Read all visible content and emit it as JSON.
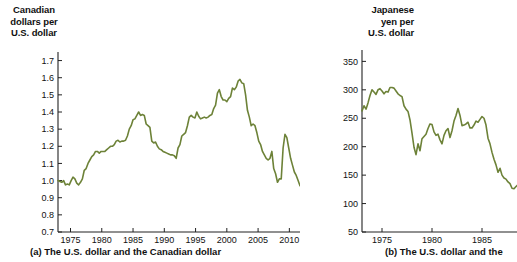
{
  "figure": {
    "background": "#ffffff",
    "line_color": "#6d8238",
    "axis_color": "#222222",
    "text_color": "#111111"
  },
  "panels": [
    {
      "id": "panel-a",
      "axis_title": "Canadian\ndollars per\nU.S. dollar",
      "caption": "(a) The U.S. dollar and the Canadian dollar"
    },
    {
      "id": "panel-b",
      "axis_title": "Japanese\nyen per\nU.S. dollar",
      "caption": "(b) The U.S. dollar and the"
    }
  ],
  "chart_data": [
    {
      "type": "line",
      "title": "(a) The U.S. dollar and the Canadian dollar",
      "xlabel": "",
      "ylabel": "Canadian dollars per U.S. dollar",
      "xlim": [
        1973,
        2016.5
      ],
      "ylim": [
        0.7,
        1.75
      ],
      "xticks": [
        1975,
        1980,
        1985,
        1990,
        1995,
        2000,
        2005,
        2010,
        2015
      ],
      "yticks": [
        0.7,
        0.8,
        0.9,
        1.0,
        1.1,
        1.2,
        1.3,
        1.4,
        1.5,
        1.6,
        1.7
      ],
      "grid": false,
      "legend": "none",
      "line_color": "#6d8238",
      "series": [
        {
          "name": "CAD per USD",
          "x": [
            1973.0,
            1973.3,
            1973.6,
            1973.9,
            1974.2,
            1974.5,
            1974.8,
            1975.1,
            1975.4,
            1975.7,
            1976.0,
            1976.3,
            1976.6,
            1976.9,
            1977.2,
            1977.5,
            1977.8,
            1978.1,
            1978.4,
            1978.7,
            1979.0,
            1979.3,
            1979.6,
            1979.9,
            1980.2,
            1980.5,
            1980.8,
            1981.1,
            1981.4,
            1981.7,
            1982.0,
            1982.3,
            1982.6,
            1982.9,
            1983.2,
            1983.5,
            1983.8,
            1984.1,
            1984.4,
            1984.7,
            1985.0,
            1985.3,
            1985.6,
            1985.9,
            1986.2,
            1986.5,
            1986.8,
            1987.1,
            1987.4,
            1987.7,
            1988.0,
            1988.3,
            1988.6,
            1988.9,
            1989.2,
            1989.5,
            1989.8,
            1990.1,
            1990.4,
            1990.7,
            1991.0,
            1991.3,
            1991.6,
            1991.9,
            1992.2,
            1992.5,
            1992.8,
            1993.1,
            1993.4,
            1993.7,
            1994.0,
            1994.3,
            1994.6,
            1994.9,
            1995.2,
            1995.5,
            1995.8,
            1996.1,
            1996.4,
            1996.7,
            1997.0,
            1997.3,
            1997.6,
            1997.9,
            1998.2,
            1998.5,
            1998.8,
            1999.1,
            1999.4,
            1999.7,
            2000.0,
            2000.3,
            2000.6,
            2000.9,
            2001.2,
            2001.5,
            2001.8,
            2002.1,
            2002.4,
            2002.7,
            2003.0,
            2003.3,
            2003.6,
            2003.9,
            2004.2,
            2004.5,
            2004.8,
            2005.1,
            2005.4,
            2005.7,
            2006.0,
            2006.3,
            2006.6,
            2006.9,
            2007.2,
            2007.5,
            2007.8,
            2008.1,
            2008.4,
            2008.7,
            2009.0,
            2009.3,
            2009.6,
            2009.9,
            2010.2,
            2010.5,
            2010.8,
            2011.1,
            2011.4,
            2011.7,
            2012.0,
            2012.3,
            2012.6,
            2012.9,
            2013.2,
            2013.5,
            2013.8,
            2014.1,
            2014.4,
            2014.7,
            2015.0,
            2015.3,
            2015.6,
            2015.9,
            2016.2
          ],
          "y": [
            1.0,
            0.995,
            0.99,
            1.0,
            0.975,
            0.98,
            0.975,
            1.0,
            1.02,
            1.01,
            0.985,
            0.975,
            0.99,
            1.01,
            1.06,
            1.07,
            1.1,
            1.12,
            1.14,
            1.15,
            1.17,
            1.17,
            1.16,
            1.17,
            1.17,
            1.17,
            1.18,
            1.19,
            1.2,
            1.2,
            1.21,
            1.23,
            1.235,
            1.225,
            1.23,
            1.23,
            1.235,
            1.26,
            1.3,
            1.32,
            1.355,
            1.36,
            1.38,
            1.4,
            1.38,
            1.385,
            1.38,
            1.33,
            1.32,
            1.31,
            1.23,
            1.22,
            1.225,
            1.2,
            1.185,
            1.18,
            1.17,
            1.165,
            1.16,
            1.155,
            1.15,
            1.15,
            1.145,
            1.13,
            1.19,
            1.21,
            1.26,
            1.27,
            1.28,
            1.32,
            1.37,
            1.38,
            1.37,
            1.365,
            1.4,
            1.375,
            1.36,
            1.365,
            1.37,
            1.365,
            1.37,
            1.38,
            1.385,
            1.42,
            1.44,
            1.51,
            1.53,
            1.49,
            1.47,
            1.47,
            1.46,
            1.48,
            1.49,
            1.54,
            1.53,
            1.545,
            1.58,
            1.59,
            1.57,
            1.565,
            1.5,
            1.41,
            1.37,
            1.32,
            1.33,
            1.32,
            1.28,
            1.23,
            1.21,
            1.17,
            1.15,
            1.13,
            1.12,
            1.13,
            1.17,
            1.07,
            1.04,
            0.99,
            1.01,
            1.01,
            1.19,
            1.27,
            1.25,
            1.19,
            1.13,
            1.09,
            1.05,
            1.03,
            1.0,
            0.97,
            0.98,
            1.01,
            1.0,
            0.99,
            1.0,
            1.0,
            1.02,
            1.04,
            1.06,
            1.09,
            1.1,
            1.13,
            1.2,
            1.24,
            1.3,
            1.33
          ]
        }
      ]
    },
    {
      "type": "line",
      "title": "(b) The U.S. dollar and the",
      "xlabel": "",
      "ylabel": "Japanese yen per U.S. dollar",
      "xlim": [
        1973,
        1990
      ],
      "ylim": [
        50,
        370
      ],
      "xticks": [
        1975,
        1980,
        1985,
        1990
      ],
      "yticks": [
        50,
        100,
        150,
        200,
        250,
        300,
        350
      ],
      "grid": false,
      "legend": "none",
      "line_color": "#6d8238",
      "series": [
        {
          "name": "JPY per USD",
          "x": [
            1973.0,
            1973.2,
            1973.4,
            1973.6,
            1973.8,
            1974.0,
            1974.2,
            1974.4,
            1974.6,
            1974.8,
            1975.0,
            1975.2,
            1975.4,
            1975.6,
            1975.8,
            1976.0,
            1976.2,
            1976.4,
            1976.6,
            1976.8,
            1977.0,
            1977.2,
            1977.4,
            1977.6,
            1977.8,
            1978.0,
            1978.2,
            1978.4,
            1978.6,
            1978.8,
            1979.0,
            1979.2,
            1979.4,
            1979.6,
            1979.8,
            1980.0,
            1980.2,
            1980.4,
            1980.6,
            1980.8,
            1981.0,
            1981.2,
            1981.4,
            1981.6,
            1981.8,
            1982.0,
            1982.2,
            1982.4,
            1982.6,
            1982.8,
            1983.0,
            1983.2,
            1983.4,
            1983.6,
            1983.8,
            1984.0,
            1984.2,
            1984.4,
            1984.6,
            1984.8,
            1985.0,
            1985.2,
            1985.4,
            1985.6,
            1985.8,
            1986.0,
            1986.2,
            1986.4,
            1986.6,
            1986.8,
            1987.0,
            1987.2,
            1987.4,
            1987.6,
            1987.8,
            1988.0,
            1988.2,
            1988.4,
            1988.6,
            1988.8,
            1989.0,
            1989.3,
            1989.6,
            1989.9
          ],
          "y": [
            263,
            272,
            266,
            277,
            290,
            300,
            296,
            292,
            300,
            302,
            298,
            293,
            297,
            296,
            304,
            304,
            303,
            298,
            293,
            290,
            288,
            272,
            266,
            262,
            247,
            224,
            199,
            186,
            205,
            193,
            214,
            218,
            222,
            232,
            240,
            239,
            226,
            220,
            222,
            212,
            205,
            220,
            228,
            232,
            216,
            228,
            245,
            255,
            267,
            255,
            237,
            238,
            240,
            243,
            233,
            233,
            238,
            245,
            243,
            248,
            253,
            250,
            238,
            215,
            205,
            190,
            178,
            168,
            155,
            162,
            150,
            145,
            143,
            138,
            135,
            127,
            126,
            130,
            133,
            125,
            130,
            138,
            143,
            142
          ]
        }
      ]
    }
  ]
}
